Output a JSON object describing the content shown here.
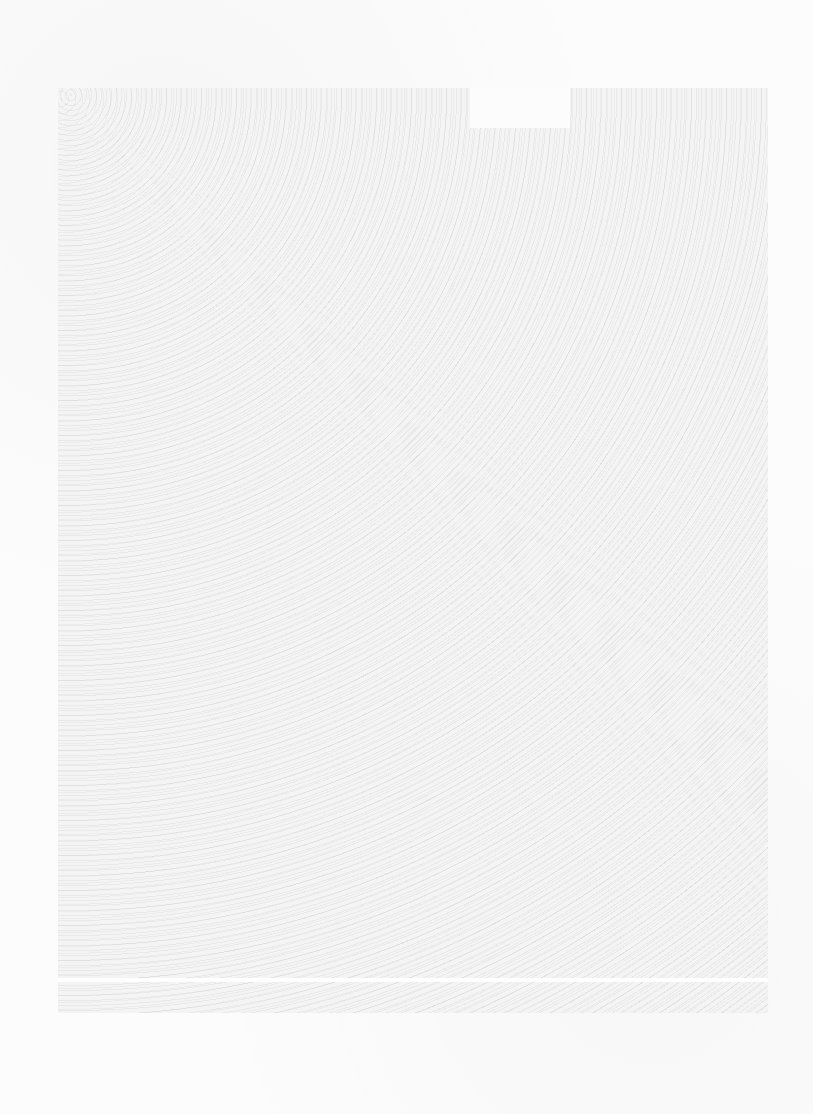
{
  "page": {
    "type": "scanned blank page with speckle texture",
    "background_color": "#fcfcfc",
    "scan_region_color": "#f4f4f4"
  },
  "caption": {
    "text": "",
    "uncertain_reading": "Image Not Found",
    "legible": false
  }
}
